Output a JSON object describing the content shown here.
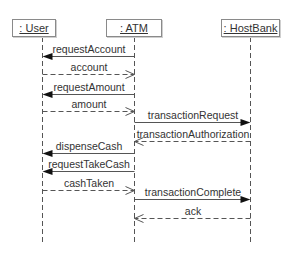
{
  "diagram": {
    "type": "UML sequence diagram",
    "objects": [
      {
        "id": "user",
        "label": ": User",
        "x": 42,
        "box_left": 12,
        "box_width": 44
      },
      {
        "id": "atm",
        "label": ": ATM",
        "x": 134,
        "box_left": 106,
        "box_width": 56
      },
      {
        "id": "hostbank",
        "label": ": HostBank",
        "x": 250,
        "box_left": 221,
        "box_width": 59
      }
    ],
    "lifeline_top": 37,
    "lifeline_bottom": 242,
    "messages": [
      {
        "label": "requestAccount",
        "from": "atm",
        "to": "user",
        "kind": "sync",
        "y": 56
      },
      {
        "label": "account",
        "from": "user",
        "to": "atm",
        "kind": "return",
        "y": 74
      },
      {
        "label": "requestAmount",
        "from": "atm",
        "to": "user",
        "kind": "sync",
        "y": 94
      },
      {
        "label": "amount",
        "from": "user",
        "to": "atm",
        "kind": "return",
        "y": 111
      },
      {
        "label": "transactionRequest",
        "from": "atm",
        "to": "hostbank",
        "kind": "sync",
        "y": 122
      },
      {
        "label": "transactionAuthorization",
        "from": "hostbank",
        "to": "atm",
        "kind": "return",
        "y": 141
      },
      {
        "label": "dispenseCash",
        "from": "atm",
        "to": "user",
        "kind": "sync",
        "y": 153
      },
      {
        "label": "requestTakeCash",
        "from": "atm",
        "to": "user",
        "kind": "sync",
        "y": 171
      },
      {
        "label": "cashTaken",
        "from": "user",
        "to": "atm",
        "kind": "return",
        "y": 190
      },
      {
        "label": "transactionComplete",
        "from": "atm",
        "to": "hostbank",
        "kind": "sync",
        "y": 199
      },
      {
        "label": "ack",
        "from": "hostbank",
        "to": "atm",
        "kind": "return",
        "y": 218
      }
    ],
    "colors": {
      "line": "#555555",
      "text": "#333333",
      "box_border": "#8a8a8a"
    }
  }
}
